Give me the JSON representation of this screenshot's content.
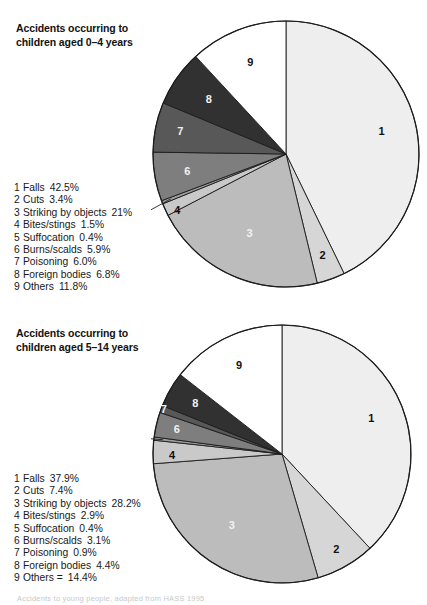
{
  "figure": {
    "footnote": "Accidents to young people, adapted from HASS 1995"
  },
  "charts": [
    {
      "id": "0-4",
      "title": "Accidents occurring to\nchildren aged 0–4 years",
      "title_line1": "Accidents occurring to",
      "title_line2": "children aged 0–4 years",
      "legend": [
        {
          "num": "1",
          "label": "Falls",
          "pct": "42.5%"
        },
        {
          "num": "2",
          "label": "Cuts",
          "pct": "3.4%"
        },
        {
          "num": "3",
          "label": "Striking by objects",
          "pct": "21%"
        },
        {
          "num": "4",
          "label": "Bites/stings",
          "pct": "1.5%"
        },
        {
          "num": "5",
          "label": "Suffocation",
          "pct": "0.4%"
        },
        {
          "num": "6",
          "label": "Burns/scalds",
          "pct": "5.9%"
        },
        {
          "num": "7",
          "label": "Poisoning",
          "pct": "6.0%"
        },
        {
          "num": "8",
          "label": "Foreign bodies",
          "pct": "6.8%"
        },
        {
          "num": "9",
          "label": "Others",
          "pct": "11.8%"
        }
      ]
    },
    {
      "id": "5-14",
      "title": "Accidents occurring to\nchildren aged 5–14 years",
      "title_line1": "Accidents occurring to",
      "title_line2": "children aged 5–14 years",
      "legend": [
        {
          "num": "1",
          "label": "Falls",
          "pct": "37.9%"
        },
        {
          "num": "2",
          "label": "Cuts",
          "pct": "7.4%"
        },
        {
          "num": "3",
          "label": "Striking by objects",
          "pct": "28.2%"
        },
        {
          "num": "4",
          "label": "Bites/stings",
          "pct": "2.9%"
        },
        {
          "num": "5",
          "label": "Suffocation",
          "pct": "0.4%"
        },
        {
          "num": "6",
          "label": "Burns/scalds",
          "pct": "3.1%"
        },
        {
          "num": "7",
          "label": "Poisoning",
          "pct": "0.9%"
        },
        {
          "num": "8",
          "label": "Foreign bodies",
          "pct": "4.4%"
        },
        {
          "num": "9",
          "label": "Others =",
          "pct": "14.4%"
        }
      ]
    }
  ],
  "chart_data": [
    {
      "type": "pie",
      "title": "Accidents occurring to children aged 0–4 years",
      "labels": [
        "1",
        "2",
        "3",
        "4",
        "5",
        "6",
        "7",
        "8",
        "9"
      ],
      "categories": [
        "Falls",
        "Cuts",
        "Striking by objects",
        "Bites/stings",
        "Suffocation",
        "Burns/scalds",
        "Poisoning",
        "Foreign bodies",
        "Others"
      ],
      "values": [
        42.5,
        3.4,
        21.0,
        1.5,
        0.4,
        5.9,
        6.0,
        6.8,
        11.8
      ],
      "unit": "%",
      "start_angle_deg": 0,
      "direction": "clockwise",
      "legend_position": "left",
      "grid": false,
      "colors": [
        "#eeeeee",
        "#d6d6d6",
        "#bcbcbc",
        "#c9c9c9",
        "#9e9e9e",
        "#7e7e7e",
        "#585858",
        "#313131",
        "#ffffff"
      ],
      "label_text_colors": [
        "dark",
        "dark",
        "light",
        "dark",
        "dark",
        "light",
        "light",
        "light",
        "dark"
      ]
    },
    {
      "type": "pie",
      "title": "Accidents occurring to children aged 5–14 years",
      "labels": [
        "1",
        "2",
        "3",
        "4",
        "5",
        "6",
        "7",
        "8",
        "9"
      ],
      "categories": [
        "Falls",
        "Cuts",
        "Striking by objects",
        "Bites/stings",
        "Suffocation",
        "Burns/scalds",
        "Poisoning",
        "Foreign bodies",
        "Others"
      ],
      "values": [
        37.9,
        7.4,
        28.2,
        2.9,
        0.4,
        3.1,
        0.9,
        4.4,
        14.4
      ],
      "unit": "%",
      "start_angle_deg": 0,
      "direction": "clockwise",
      "legend_position": "left",
      "grid": false,
      "colors": [
        "#eeeeee",
        "#d6d6d6",
        "#bcbcbc",
        "#c9c9c9",
        "#9e9e9e",
        "#7e7e7e",
        "#585858",
        "#313131",
        "#ffffff"
      ],
      "label_text_colors": [
        "dark",
        "dark",
        "light",
        "dark",
        "dark",
        "light",
        "light",
        "light",
        "dark"
      ]
    }
  ]
}
